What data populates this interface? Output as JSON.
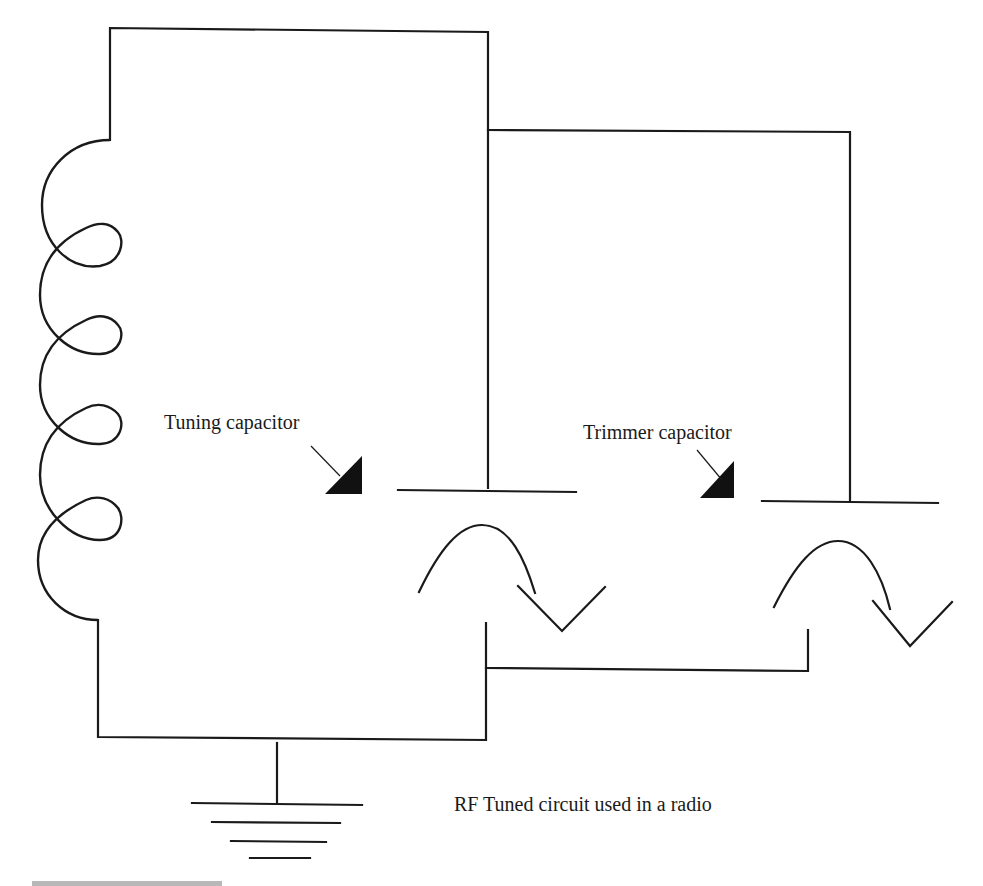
{
  "diagram": {
    "title": "RF Tuned circuit used in a radio",
    "labels": {
      "tuning_capacitor": "Tuning capacitor",
      "trimmer_capacitor": "Trimmer capacitor",
      "caption": "RF Tuned circuit used in a radio"
    },
    "components": [
      {
        "type": "inductor",
        "name": "coil",
        "turns": 4
      },
      {
        "type": "variable-capacitor",
        "name": "Tuning capacitor"
      },
      {
        "type": "variable-capacitor",
        "name": "Trimmer capacitor"
      },
      {
        "type": "ground",
        "name": "ground"
      }
    ],
    "colors": {
      "line": "#1a1a1a",
      "background": "#ffffff"
    }
  }
}
